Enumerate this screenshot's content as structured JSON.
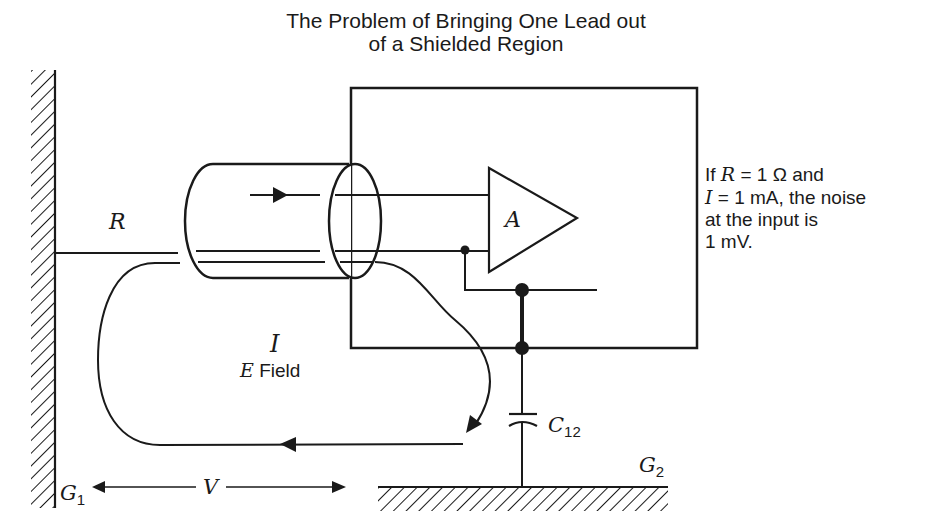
{
  "title": {
    "line1": "The Problem of Bringing One Lead out",
    "line2": "of  a Shielded Region"
  },
  "note": {
    "line1_prefix": "If ",
    "line1_var": "R",
    "line1_suffix": " = 1 Ω and",
    "line2_var": "I",
    "line2_suffix": " = 1 mA, the noise",
    "line3": "at the input is",
    "line4": "1 mV."
  },
  "labels": {
    "resistance": "R",
    "amplifier": "A",
    "current": "I",
    "field_var": "E",
    "field_text": " Field",
    "capacitor": "C",
    "capacitor_sub": "12",
    "voltage": "V",
    "ground1": "G",
    "ground1_sub": "1",
    "ground2": "G",
    "ground2_sub": "2"
  },
  "colors": {
    "ink": "#1a1a1a",
    "background": "#ffffff"
  }
}
